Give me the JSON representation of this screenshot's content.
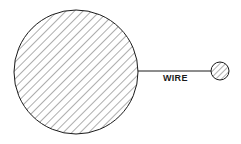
{
  "diagram": {
    "wire_label": "WIRE",
    "large_sphere": {
      "cx": 76,
      "cy": 72,
      "r": 62,
      "fill": "hatched"
    },
    "small_sphere": {
      "cx": 220,
      "cy": 71,
      "r": 9,
      "fill": "hatched"
    },
    "wire": {
      "x1": 138,
      "y1": 71,
      "x2": 211,
      "y2": 71
    },
    "colors": {
      "stroke": "#1a1a1a",
      "background": "#ffffff"
    }
  }
}
